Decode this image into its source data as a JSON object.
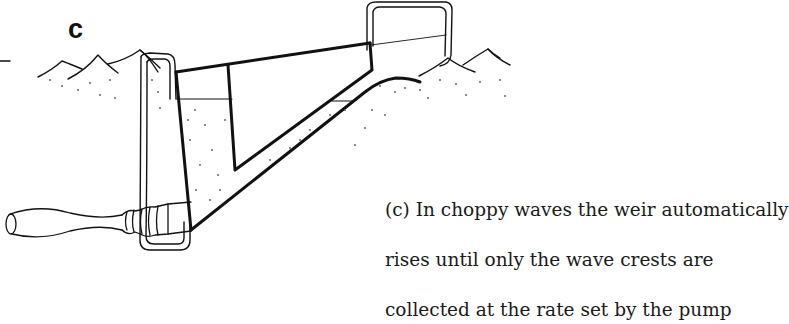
{
  "figure": {
    "panel_label": "c",
    "caption_lines": [
      "(c)  In choppy waves the weir automatically",
      "rises until only the wave crests are",
      "collected at the rate set by the pump"
    ],
    "colors": {
      "line": "#111111",
      "background": "#ffffff",
      "stipple": "#555555"
    },
    "parts": [
      "water-surface-waves",
      "floating-weir-skimmer",
      "float-loop",
      "collection-chamber",
      "threaded-fitting",
      "suction-hose"
    ]
  }
}
